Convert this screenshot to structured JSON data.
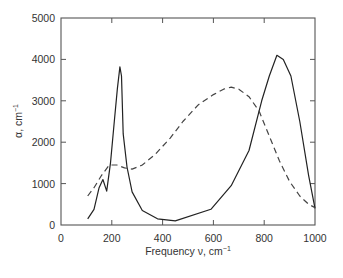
{
  "chart_data": {
    "type": "line",
    "title": "",
    "xlabel": "Frequency ν, cm⁻¹",
    "ylabel": "α, cm⁻¹",
    "xlim": [
      0,
      1000
    ],
    "ylim": [
      0,
      5000
    ],
    "x_ticks": [
      0,
      200,
      400,
      600,
      800,
      1000
    ],
    "y_ticks": [
      0,
      1000,
      2000,
      3000,
      4000,
      5000
    ],
    "grid": false,
    "legend": null,
    "series": [
      {
        "name": "solid",
        "style": "solid",
        "color": "#222222",
        "x": [
          105,
          130,
          150,
          165,
          180,
          195,
          210,
          222,
          232,
          238,
          245,
          260,
          280,
          320,
          380,
          450,
          590,
          670,
          740,
          790,
          820,
          850,
          875,
          905,
          940,
          975,
          1000
        ],
        "y": [
          150,
          380,
          900,
          1100,
          820,
          1500,
          2500,
          3300,
          3820,
          3600,
          2200,
          1400,
          800,
          350,
          150,
          100,
          380,
          950,
          1800,
          3000,
          3600,
          4100,
          4000,
          3600,
          2500,
          1200,
          400
        ]
      },
      {
        "name": "dashed",
        "style": "dashed",
        "color": "#444444",
        "x": [
          105,
          130,
          160,
          190,
          220,
          250,
          280,
          320,
          370,
          430,
          480,
          540,
          600,
          640,
          670,
          700,
          740,
          780,
          820,
          860,
          900,
          940,
          975,
          1000
        ],
        "y": [
          700,
          900,
          1200,
          1450,
          1450,
          1380,
          1350,
          1450,
          1700,
          2100,
          2500,
          2900,
          3150,
          3280,
          3330,
          3280,
          3100,
          2750,
          2150,
          1550,
          1050,
          700,
          500,
          420
        ]
      }
    ]
  },
  "axes": {
    "x_tick_labels": [
      "0",
      "200",
      "400",
      "600",
      "800",
      "1000"
    ],
    "y_tick_labels": [
      "0",
      "1000",
      "2000",
      "3000",
      "4000",
      "5000"
    ],
    "xlabel_main": "Frequency ν, cm",
    "xlabel_sup": "−1",
    "ylabel_main": "α, cm",
    "ylabel_sup": "−1"
  }
}
